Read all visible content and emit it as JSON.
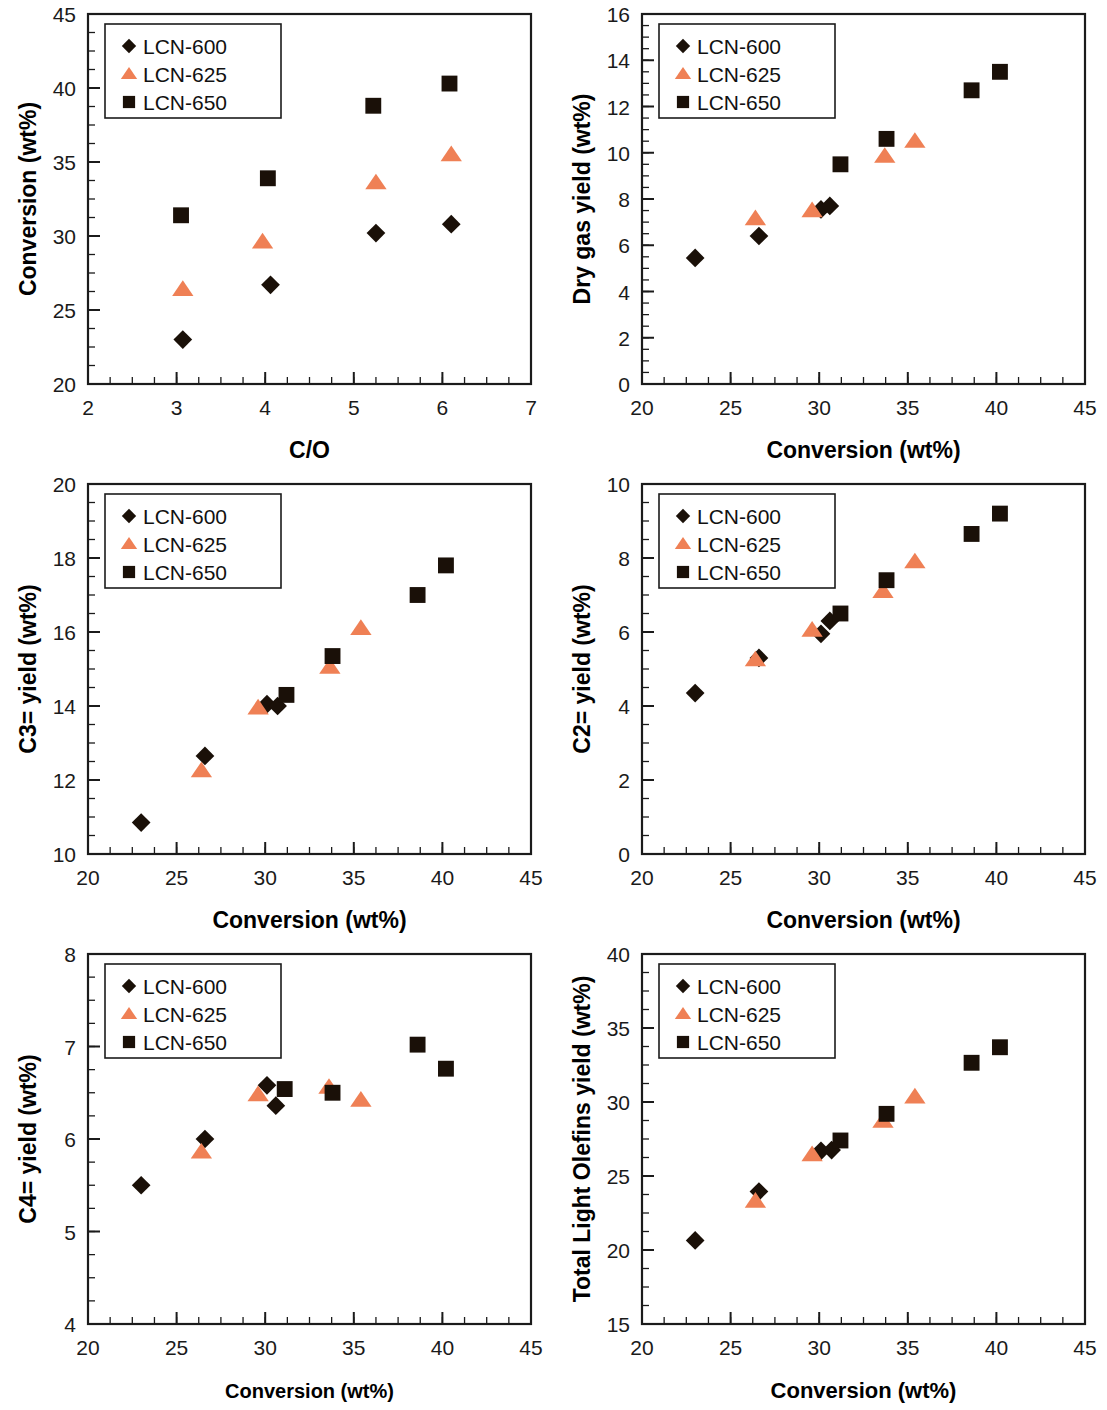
{
  "figure": {
    "series_names": [
      "LCN-600",
      "LCN-625",
      "LCN-650"
    ],
    "colors": {
      "LCN-600": "#1a1008",
      "LCN-625": "#ef8055",
      "LCN-650": "#1a1008"
    },
    "markers": {
      "LCN-600": "diamond",
      "LCN-625": "triangle",
      "LCN-650": "square"
    }
  },
  "chart_data": [
    {
      "id": "conversion-vs-co",
      "type": "scatter",
      "title": "",
      "xlabel": "C/O",
      "ylabel": "Conversion (wt%)",
      "xlim": [
        2,
        7
      ],
      "ylim": [
        20,
        45
      ],
      "xticks": [
        2,
        3,
        4,
        5,
        6,
        7
      ],
      "yticks": [
        20,
        25,
        30,
        35,
        40,
        45
      ],
      "xminor": 0.25,
      "yminor": 1.25,
      "grid": false,
      "legend_position": "top-left",
      "legend": [
        "LCN-600",
        "LCN-625",
        "LCN-650"
      ],
      "series": [
        {
          "name": "LCN-600",
          "points": [
            [
              3.07,
              23.0
            ],
            [
              4.06,
              26.7
            ],
            [
              5.25,
              30.2
            ],
            [
              6.1,
              30.8
            ]
          ]
        },
        {
          "name": "LCN-625",
          "points": [
            [
              3.07,
              26.4
            ],
            [
              3.97,
              29.6
            ],
            [
              5.25,
              33.6
            ],
            [
              6.1,
              35.5
            ]
          ]
        },
        {
          "name": "LCN-650",
          "points": [
            [
              3.05,
              31.4
            ],
            [
              4.03,
              33.9
            ],
            [
              5.22,
              38.8
            ],
            [
              6.08,
              40.3
            ]
          ]
        }
      ]
    },
    {
      "id": "dry-gas-yield-vs-conversion",
      "type": "scatter",
      "title": "",
      "xlabel": "Conversion (wt%)",
      "ylabel": "Dry gas yield (wt%)",
      "xlim": [
        20,
        45
      ],
      "ylim": [
        0,
        16
      ],
      "xticks": [
        20,
        25,
        30,
        35,
        40,
        45
      ],
      "yticks": [
        0,
        2,
        4,
        6,
        8,
        10,
        12,
        14,
        16
      ],
      "xminor": 1.25,
      "yminor": 0.5,
      "grid": false,
      "legend_position": "top-left",
      "legend": [
        "LCN-600",
        "LCN-625",
        "LCN-650"
      ],
      "series": [
        {
          "name": "LCN-600",
          "points": [
            [
              23.0,
              5.45
            ],
            [
              26.6,
              6.4
            ],
            [
              30.1,
              7.55
            ],
            [
              30.6,
              7.7
            ]
          ]
        },
        {
          "name": "LCN-625",
          "points": [
            [
              26.4,
              7.15
            ],
            [
              29.6,
              7.5
            ],
            [
              33.7,
              9.85
            ],
            [
              35.4,
              10.5
            ]
          ]
        },
        {
          "name": "LCN-650",
          "points": [
            [
              31.2,
              9.5
            ],
            [
              33.8,
              10.6
            ],
            [
              38.6,
              12.7
            ],
            [
              40.2,
              13.5
            ]
          ]
        }
      ]
    },
    {
      "id": "c3-yield-vs-conversion",
      "type": "scatter",
      "title": "",
      "xlabel": "Conversion (wt%)",
      "ylabel": "C3= yield (wt%)",
      "xlim": [
        20,
        45
      ],
      "ylim": [
        10,
        20
      ],
      "xticks": [
        20,
        25,
        30,
        35,
        40,
        45
      ],
      "yticks": [
        10,
        12,
        14,
        16,
        18,
        20
      ],
      "xminor": 1.25,
      "yminor": 0.5,
      "grid": false,
      "legend_position": "top-left",
      "legend": [
        "LCN-600",
        "LCN-625",
        "LCN-650"
      ],
      "series": [
        {
          "name": "LCN-600",
          "points": [
            [
              23.0,
              10.85
            ],
            [
              26.6,
              12.65
            ],
            [
              30.1,
              14.05
            ],
            [
              30.7,
              14.0
            ]
          ]
        },
        {
          "name": "LCN-625",
          "points": [
            [
              26.4,
              12.25
            ],
            [
              29.6,
              13.95
            ],
            [
              33.65,
              15.05
            ],
            [
              35.4,
              16.1
            ]
          ]
        },
        {
          "name": "LCN-650",
          "points": [
            [
              31.2,
              14.3
            ],
            [
              33.8,
              15.35
            ],
            [
              38.6,
              17.0
            ],
            [
              40.2,
              17.8
            ]
          ]
        }
      ]
    },
    {
      "id": "c2-yield-vs-conversion",
      "type": "scatter",
      "title": "",
      "xlabel": "Conversion (wt%)",
      "ylabel": "C2= yield (wt%)",
      "xlim": [
        20,
        45
      ],
      "ylim": [
        0,
        10
      ],
      "xticks": [
        20,
        25,
        30,
        35,
        40,
        45
      ],
      "yticks": [
        0,
        2,
        4,
        6,
        8,
        10
      ],
      "xminor": 1.25,
      "yminor": 0.5,
      "grid": false,
      "legend_position": "top-left",
      "legend": [
        "LCN-600",
        "LCN-625",
        "LCN-650"
      ],
      "series": [
        {
          "name": "LCN-600",
          "points": [
            [
              23.0,
              4.35
            ],
            [
              26.6,
              5.3
            ],
            [
              30.1,
              5.95
            ],
            [
              30.6,
              6.3
            ]
          ]
        },
        {
          "name": "LCN-625",
          "points": [
            [
              26.4,
              5.25
            ],
            [
              29.6,
              6.05
            ],
            [
              33.6,
              7.1
            ],
            [
              35.4,
              7.9
            ]
          ]
        },
        {
          "name": "LCN-650",
          "points": [
            [
              31.2,
              6.5
            ],
            [
              33.8,
              7.4
            ],
            [
              38.6,
              8.65
            ],
            [
              40.2,
              9.2
            ]
          ]
        }
      ]
    },
    {
      "id": "c4-yield-vs-conversion",
      "type": "scatter",
      "title": "",
      "xlabel": "Conversion (wt%)",
      "ylabel": "C4= yield (wt%)",
      "xlim": [
        20,
        45
      ],
      "ylim": [
        4,
        8
      ],
      "xticks": [
        20,
        25,
        30,
        35,
        40,
        45
      ],
      "yticks": [
        4,
        5,
        6,
        7,
        8
      ],
      "xminor": 1.25,
      "yminor": 0.25,
      "grid": false,
      "legend_position": "top-left",
      "legend": [
        "LCN-600",
        "LCN-625",
        "LCN-650"
      ],
      "series": [
        {
          "name": "LCN-600",
          "points": [
            [
              23.0,
              5.5
            ],
            [
              26.6,
              6.0
            ],
            [
              30.1,
              6.58
            ],
            [
              30.6,
              6.36
            ]
          ]
        },
        {
          "name": "LCN-625",
          "points": [
            [
              26.4,
              5.86
            ],
            [
              29.6,
              6.48
            ],
            [
              33.6,
              6.56
            ],
            [
              35.4,
              6.42
            ]
          ]
        },
        {
          "name": "LCN-650",
          "points": [
            [
              31.1,
              6.54
            ],
            [
              33.8,
              6.5
            ],
            [
              38.6,
              7.02
            ],
            [
              40.2,
              6.76
            ]
          ]
        }
      ]
    },
    {
      "id": "total-light-olefins-yield-vs-conversion",
      "type": "scatter",
      "title": "",
      "xlabel": "Conversion (wt%)",
      "ylabel": "Total Light Olefins yield (wt%)",
      "xlim": [
        20,
        45
      ],
      "ylim": [
        15,
        40
      ],
      "xticks": [
        20,
        25,
        30,
        35,
        40,
        45
      ],
      "yticks": [
        15,
        20,
        25,
        30,
        35,
        40
      ],
      "xminor": 1.25,
      "yminor": 1.25,
      "grid": false,
      "legend_position": "top-left",
      "legend": [
        "LCN-600",
        "LCN-625",
        "LCN-650"
      ],
      "series": [
        {
          "name": "LCN-600",
          "points": [
            [
              23.0,
              20.65
            ],
            [
              26.6,
              23.95
            ],
            [
              30.1,
              26.7
            ],
            [
              30.7,
              26.75
            ]
          ]
        },
        {
          "name": "LCN-625",
          "points": [
            [
              26.4,
              23.3
            ],
            [
              29.6,
              26.45
            ],
            [
              33.6,
              28.7
            ],
            [
              35.4,
              30.35
            ]
          ]
        },
        {
          "name": "LCN-650",
          "points": [
            [
              31.2,
              27.4
            ],
            [
              33.8,
              29.2
            ],
            [
              38.6,
              32.65
            ],
            [
              40.2,
              33.7
            ]
          ]
        }
      ]
    }
  ],
  "panels": [
    {
      "x": 0,
      "y": 0,
      "w": 553,
      "h": 470,
      "chart": 0,
      "xlabel_bold_size": 23,
      "ylabel_size": 23
    },
    {
      "x": 554,
      "y": 0,
      "w": 553,
      "h": 470,
      "chart": 1,
      "xlabel_bold_size": 23,
      "ylabel_size": 23
    },
    {
      "x": 0,
      "y": 470,
      "w": 553,
      "h": 470,
      "chart": 2,
      "xlabel_bold_size": 23,
      "ylabel_size": 23
    },
    {
      "x": 554,
      "y": 470,
      "w": 553,
      "h": 470,
      "chart": 3,
      "xlabel_bold_size": 23,
      "ylabel_size": 23
    },
    {
      "x": 0,
      "y": 940,
      "w": 553,
      "h": 470,
      "chart": 4,
      "xlabel_bold_size": 20,
      "ylabel_size": 23
    },
    {
      "x": 554,
      "y": 940,
      "w": 553,
      "h": 470,
      "chart": 5,
      "xlabel_bold_size": 22,
      "ylabel_size": 23
    }
  ]
}
